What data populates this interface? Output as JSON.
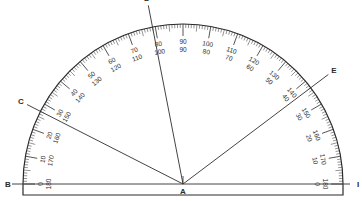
{
  "diagram": {
    "type": "protractor",
    "center": {
      "label": "A",
      "x": 183,
      "y": 184
    },
    "outer_radius": 160,
    "baseline": {
      "left_label": "B",
      "right_label": "I"
    },
    "colors": {
      "ink": "#2a2a2a",
      "background": "#ffffff",
      "line": "#444444"
    },
    "outer_scale_labels": [
      "0",
      "10",
      "20",
      "30",
      "40",
      "50",
      "60",
      "70",
      "80",
      "90",
      "100",
      "110",
      "120",
      "130",
      "140",
      "150",
      "160",
      "170",
      "180"
    ],
    "inner_scale_labels": [
      "180",
      "170",
      "160",
      "150",
      "140",
      "130",
      "120",
      "110",
      "100",
      "90",
      "80",
      "70",
      "60",
      "50",
      "40",
      "30",
      "20",
      "10",
      "0"
    ],
    "rays": [
      {
        "label": "C",
        "angle_deg": 153,
        "length": 175
      },
      {
        "label": "D",
        "angle_deg": 101,
        "length": 182
      },
      {
        "label": "E",
        "angle_deg": 37,
        "length": 182
      }
    ]
  }
}
